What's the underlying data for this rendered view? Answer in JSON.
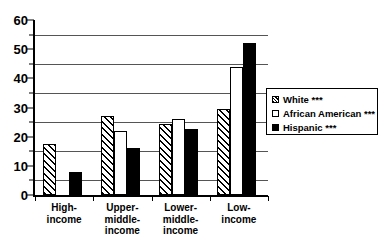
{
  "chart_data": {
    "type": "bar",
    "title": "",
    "subtitle": "",
    "xlabel": "",
    "ylabel": "",
    "ylim": [
      0,
      60
    ],
    "y_ticks": [
      0,
      10,
      20,
      30,
      40,
      50,
      60
    ],
    "y_tick_labels": [
      "0",
      "10",
      "20",
      "30",
      "40",
      "50",
      "60"
    ],
    "gridlines": [
      5,
      15,
      25,
      35,
      45,
      55
    ],
    "grid": true,
    "legend_position": "right",
    "orientation": "vertical",
    "categories": [
      "High-\nincome",
      "Upper-\nmiddle-\nincome",
      "Lower-\nmiddle-\nincome",
      "Low-\nincome"
    ],
    "series": [
      {
        "name": "White ***",
        "fill": "diagonal-hatch",
        "color": "#000000",
        "values": [
          17.5,
          27,
          24.5,
          29.5
        ]
      },
      {
        "name": "African American ***",
        "fill": "empty",
        "color": "#ffffff",
        "values": [
          0,
          22,
          26,
          44
        ]
      },
      {
        "name": "Hispanic ***",
        "fill": "solid",
        "color": "#000000",
        "values": [
          8,
          16,
          22.5,
          52
        ]
      }
    ]
  },
  "legend": {
    "items": [
      {
        "label": "White ***",
        "swatch": "hatch-swatch"
      },
      {
        "label": "African American ***",
        "swatch": "empty-swatch"
      },
      {
        "label": "Hispanic ***",
        "swatch": "solid-swatch"
      }
    ]
  }
}
